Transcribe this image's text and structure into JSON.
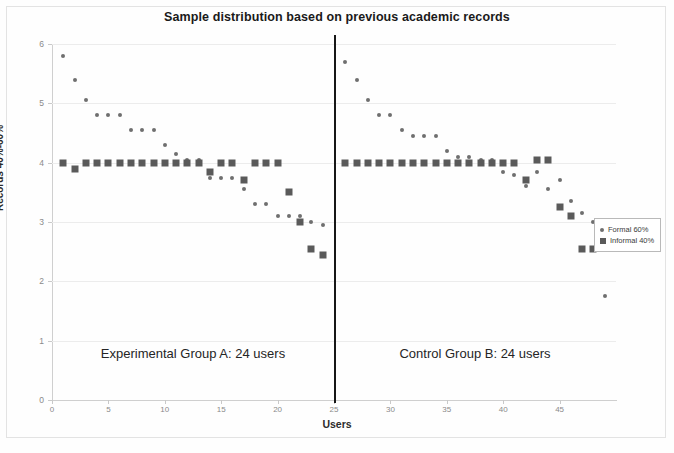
{
  "chart_data": {
    "type": "scatter",
    "title": "Sample distribution based on previous academic records",
    "xlabel": "Users",
    "ylabel": "Records 40%-60%",
    "xlim": [
      0,
      50
    ],
    "ylim": [
      0,
      6
    ],
    "xticks": [
      0,
      5,
      10,
      15,
      20,
      25,
      30,
      35,
      40,
      45
    ],
    "yticks": [
      0,
      1,
      2,
      3,
      4,
      5,
      6
    ],
    "grid": true,
    "legend_position": "right",
    "series": [
      {
        "name": "Formal 60%",
        "marker": "dot",
        "color": "#6f6f6f",
        "x": [
          1,
          2,
          3,
          4,
          5,
          6,
          7,
          8,
          9,
          10,
          11,
          12,
          13,
          14,
          15,
          16,
          17,
          18,
          19,
          20,
          21,
          22,
          23,
          24,
          26,
          27,
          28,
          29,
          30,
          31,
          32,
          33,
          34,
          35,
          36,
          37,
          38,
          39,
          40,
          41,
          42,
          43,
          44,
          45,
          46,
          47,
          48,
          49
        ],
        "y": [
          5.8,
          5.4,
          5.05,
          4.8,
          4.8,
          4.8,
          4.55,
          4.55,
          4.55,
          4.3,
          4.15,
          4.05,
          4.05,
          3.75,
          3.75,
          3.75,
          3.55,
          3.3,
          3.3,
          3.1,
          3.1,
          3.1,
          3.0,
          2.95,
          5.7,
          5.4,
          5.05,
          4.8,
          4.8,
          4.55,
          4.45,
          4.45,
          4.45,
          4.2,
          4.1,
          4.1,
          4.05,
          4.05,
          3.85,
          3.8,
          3.6,
          3.85,
          3.55,
          3.7,
          3.35,
          3.15,
          3.0,
          1.75
        ]
      },
      {
        "name": "Informal 40%",
        "marker": "square",
        "color": "#5a5a5a",
        "x": [
          1,
          2,
          3,
          4,
          5,
          6,
          7,
          8,
          9,
          10,
          11,
          12,
          13,
          14,
          15,
          16,
          17,
          18,
          19,
          20,
          21,
          22,
          23,
          24,
          26,
          27,
          28,
          29,
          30,
          31,
          32,
          33,
          34,
          35,
          36,
          37,
          38,
          39,
          40,
          41,
          42,
          43,
          44,
          45,
          46,
          47,
          48
        ],
        "y": [
          4.0,
          3.9,
          4.0,
          4.0,
          4.0,
          4.0,
          4.0,
          4.0,
          4.0,
          4.0,
          4.0,
          4.0,
          4.0,
          3.85,
          4.0,
          4.0,
          3.7,
          4.0,
          4.0,
          4.0,
          3.5,
          3.0,
          2.55,
          2.45,
          4.0,
          4.0,
          4.0,
          4.0,
          4.0,
          4.0,
          4.0,
          4.0,
          4.0,
          4.0,
          4.0,
          4.0,
          4.0,
          4.0,
          4.0,
          4.0,
          3.7,
          4.05,
          4.05,
          3.25,
          3.1,
          2.55,
          2.55
        ]
      }
    ],
    "annotations": [
      {
        "name": "group-divider",
        "type": "vline",
        "x": 25
      },
      {
        "name": "experimental-group-label",
        "text": "Experimental Group A: 24 users",
        "x": 12.5,
        "y": 0.8
      },
      {
        "name": "control-group-label",
        "text": "Control Group B: 24 users",
        "x": 37.5,
        "y": 0.8
      }
    ]
  },
  "legend": {
    "items": [
      {
        "label": "Formal 60%",
        "marker": "dot"
      },
      {
        "label": "Informal 40%",
        "marker": "square"
      }
    ]
  }
}
